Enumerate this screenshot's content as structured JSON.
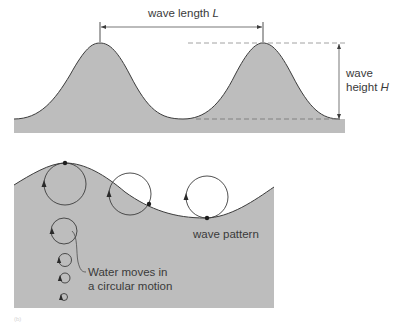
{
  "colors": {
    "water_fill": "#bdbdbd",
    "outline": "#3c3c3c",
    "dash": "#8a8a8a",
    "text": "#3a3a3a",
    "background": "#ffffff"
  },
  "top_panel": {
    "wave_length_label": "wave length",
    "wave_length_symbol": "L",
    "wave_height_label_line1": "wave",
    "wave_height_label_line2": "height",
    "wave_height_symbol": "H"
  },
  "bottom_panel": {
    "wave_pattern_label": "wave pattern",
    "circular_motion_line1": "Water moves in",
    "circular_motion_line2": "a circular motion",
    "panel_marker": "(b)"
  }
}
